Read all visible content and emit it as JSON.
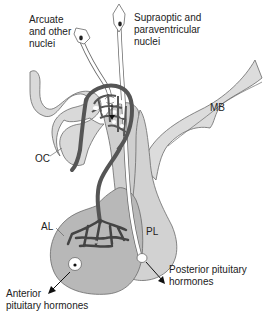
{
  "diagram": {
    "colors": {
      "tissue_fill": "#d9d9d9",
      "pituitary_fill": "#bdbdbd",
      "vessel": "#555555",
      "outline": "#666666",
      "text": "#222222"
    },
    "labels": {
      "arcuate_line1": "Arcuate",
      "arcuate_line2": "and other",
      "arcuate_line3": "nuclei",
      "supraoptic_line1": "Supraoptic and",
      "supraoptic_line2": "paraventricular",
      "supraoptic_line3": "nuclei",
      "mb": "MB",
      "oc": "OC",
      "al": "AL",
      "pl": "PL",
      "posterior_line1": "Posterior pituitary",
      "posterior_line2": "hormones",
      "anterior_line1": "Anterior",
      "anterior_line2": "pituitary hormones"
    },
    "legend_meaning": {
      "MB": "Mammillary body",
      "OC": "Optic chiasm",
      "AL": "Anterior lobe",
      "PL": "Posterior lobe"
    }
  }
}
